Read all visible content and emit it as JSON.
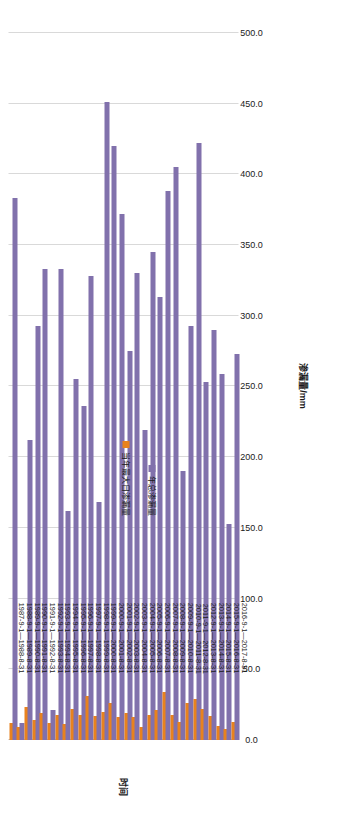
{
  "chart_data": {
    "type": "bar",
    "orientation": "horizontal-rotated",
    "title": "",
    "xlabel": "时间",
    "ylabel": "渗漏量/mm",
    "ylim": [
      0,
      500
    ],
    "ytick_labels": [
      "0.0",
      "50.0",
      "100.0",
      "150.0",
      "200.0",
      "250.0",
      "300.0",
      "350.0",
      "400.0",
      "450.0",
      "500.0"
    ],
    "ytick_values": [
      0,
      50,
      100,
      150,
      200,
      250,
      300,
      350,
      400,
      450,
      500
    ],
    "grid": true,
    "legend_position": "right",
    "categories": [
      "1987-9-1—1988-8-31",
      "1988-9-1—1989-8-31",
      "1989-9-1—1990-8-31",
      "1990-9-1—1991-8-31",
      "1991-9-1—1992-8-31",
      "1992-9-1—1993-8-31",
      "1993-9-1—1994-8-31",
      "1994-9-1—1995-8-31",
      "1995-9-1—1996-8-31",
      "1996-9-1—1997-8-31",
      "1997-9-1—1998-8-31",
      "1998-9-1—1999-8-31",
      "1999-9-1—2000-8-31",
      "2000-9-1—2001-8-31",
      "2001-9-1—2002-8-31",
      "2002-9-1—2003-8-31",
      "2003-9-1—2004-8-31",
      "2004-9-1—2005-8-31",
      "2005-9-1—2006-8-31",
      "2006-9-1—2007-8-31",
      "2007-9-1—2008-8-31",
      "2008-9-1—2009-8-31",
      "2009-9-1—2010-8-31",
      "2010-9-1—2011-8-31",
      "2011-9-1—2012-8-31",
      "2012-9-1—2013-8-31",
      "2013-9-1—2014-8-31",
      "2014-9-1—2015-8-31",
      "2015-9-1—2016-8-31",
      "2016-9-1—2017-8-31"
    ],
    "series": [
      {
        "name": "年总渗漏量",
        "color": "#8171ac",
        "values": [
          383.0,
          12.0,
          212.0,
          293.0,
          333.0,
          21.0,
          333.0,
          162.0,
          255.0,
          236.0,
          328.0,
          168.0,
          451.0,
          420.0,
          372.0,
          275.0,
          330.0,
          219.0,
          345.0,
          313.0,
          388.0,
          405.0,
          190.0,
          293.0,
          422.0,
          253.0,
          290.0,
          259.0,
          153.0,
          273.0
        ]
      },
      {
        "name": "当年最大日渗漏量",
        "color": "#e8821e",
        "values": [
          12.0,
          9.0,
          23.0,
          14.0,
          19.0,
          12.0,
          18.0,
          11.0,
          22.0,
          18.0,
          31.0,
          17.0,
          20.0,
          26.0,
          16.0,
          19.0,
          16.0,
          9.0,
          18.0,
          21.0,
          34.0,
          18.0,
          13.0,
          26.0,
          29.0,
          22.0,
          17.0,
          10.0,
          8.0,
          13.0
        ]
      }
    ]
  },
  "legend": {
    "items": [
      {
        "label": "当年最大日渗漏量",
        "color": "#e8821e"
      },
      {
        "label": "年总渗漏量",
        "color": "#8171ac"
      }
    ]
  },
  "axes": {
    "value_axis_title": "渗漏量/mm",
    "category_axis_title": "时间"
  }
}
